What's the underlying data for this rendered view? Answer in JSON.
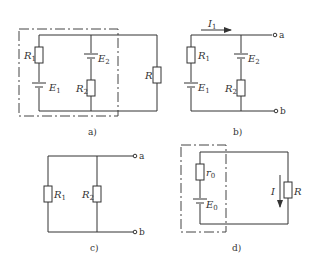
{
  "figure": {
    "panels": [
      {
        "id": "a",
        "caption": "a)",
        "labels": {
          "R1": "R",
          "R1_sub": "1",
          "E1": "E",
          "E1_sub": "1",
          "E2": "E",
          "E2_sub": "2",
          "R2": "R",
          "R2_sub": "2",
          "R": "R"
        }
      },
      {
        "id": "b",
        "caption": "b)",
        "labels": {
          "I1": "I",
          "I1_sub": "1",
          "R1": "R",
          "R1_sub": "1",
          "E1": "E",
          "E1_sub": "1",
          "E2": "E",
          "E2_sub": "2",
          "R2": "R",
          "R2_sub": "2",
          "terminal_a": "a",
          "terminal_b": "b"
        }
      },
      {
        "id": "c",
        "caption": "c)",
        "labels": {
          "R1": "R",
          "R1_sub": "1",
          "R2": "R",
          "R2_sub": "2",
          "terminal_a": "a",
          "terminal_b": "b"
        }
      },
      {
        "id": "d",
        "caption": "d)",
        "labels": {
          "r0": "r",
          "r0_sub": "0",
          "E0": "E",
          "E0_sub": "0",
          "I": "I",
          "R": "R"
        }
      }
    ]
  }
}
